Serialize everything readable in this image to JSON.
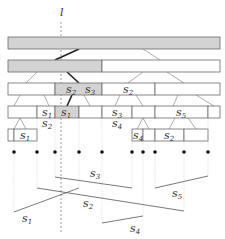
{
  "diagram": {
    "sweep_line": {
      "label": "l",
      "x": 61
    },
    "colors": {
      "highlight": "#d3d3d3",
      "box": "#ffffff",
      "thick_edge": "#222222"
    },
    "tree_rows": [
      {
        "y": 37,
        "h": 12,
        "cells": [
          {
            "x0": 8,
            "x1": 220,
            "gray": true,
            "label": ""
          }
        ]
      },
      {
        "y": 60,
        "h": 12,
        "cells": [
          {
            "x0": 8,
            "x1": 102,
            "gray": true,
            "label": ""
          },
          {
            "x0": 102,
            "x1": 220,
            "gray": false,
            "label": ""
          }
        ]
      },
      {
        "y": 83,
        "h": 12,
        "cells": [
          {
            "x0": 8,
            "x1": 55,
            "gray": false,
            "label": ""
          },
          {
            "x0": 55,
            "x1": 102,
            "gray": true,
            "label": "s2 s3"
          },
          {
            "x0": 102,
            "x1": 155,
            "gray": false,
            "label": "s2"
          },
          {
            "x0": 155,
            "x1": 220,
            "gray": false,
            "label": ""
          }
        ]
      },
      {
        "y": 106,
        "h": 12,
        "cells": [
          {
            "x0": 8,
            "x1": 37,
            "gray": false,
            "label": ""
          },
          {
            "x0": 37,
            "x1": 55,
            "gray": false,
            "label": "s1"
          },
          {
            "x0": 55,
            "x1": 79,
            "gray": true,
            "label": "s1"
          },
          {
            "x0": 79,
            "x1": 102,
            "gray": false,
            "label": ""
          },
          {
            "x0": 102,
            "x1": 132,
            "gray": false,
            "label": "s3"
          },
          {
            "x0": 132,
            "x1": 155,
            "gray": false,
            "label": ""
          },
          {
            "x0": 155,
            "x1": 208,
            "gray": false,
            "label": "s5"
          },
          {
            "x0": 208,
            "x1": 220,
            "gray": false,
            "label": ""
          }
        ]
      },
      {
        "y": 129,
        "h": 12,
        "cells": [
          {
            "x0": 8,
            "x1": 14,
            "gray": false,
            "label": ""
          },
          {
            "x0": 14,
            "x1": 37,
            "gray": false,
            "label": "s1"
          },
          {
            "x0": 132,
            "x1": 143,
            "gray": false,
            "label": "s4"
          },
          {
            "x0": 143,
            "x1": 155,
            "gray": false,
            "label": ""
          },
          {
            "x0": 155,
            "x1": 184,
            "gray": false,
            "label": "s2"
          },
          {
            "x0": 184,
            "x1": 208,
            "gray": false,
            "label": ""
          }
        ]
      }
    ],
    "below_labels": [
      {
        "text": "s2",
        "x": 42,
        "y": 127
      },
      {
        "text": "s4",
        "x": 112,
        "y": 127
      }
    ],
    "endpoints_x": [
      14,
      37,
      55,
      79,
      102,
      132,
      143,
      155,
      184,
      208
    ],
    "endpoints_y": 152,
    "segments": [
      {
        "name": "s1",
        "x1": 14,
        "y1": 212,
        "x2": 79,
        "y2": 188,
        "label_x": 22,
        "label_y": 222
      },
      {
        "name": "s2",
        "x1": 37,
        "y1": 188,
        "x2": 184,
        "y2": 211,
        "label_x": 83,
        "label_y": 207
      },
      {
        "name": "s3",
        "x1": 55,
        "y1": 177,
        "x2": 132,
        "y2": 188,
        "label_x": 90,
        "label_y": 177
      },
      {
        "name": "s4",
        "x1": 102,
        "y1": 223,
        "x2": 143,
        "y2": 216,
        "label_x": 130,
        "label_y": 232
      },
      {
        "name": "s5",
        "x1": 155,
        "y1": 188,
        "x2": 208,
        "y2": 176,
        "label_x": 172,
        "label_y": 197
      }
    ]
  }
}
